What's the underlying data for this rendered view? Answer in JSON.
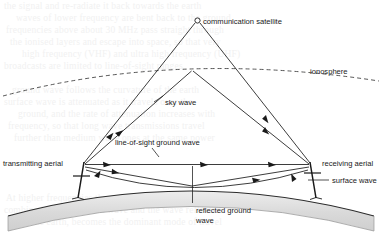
{
  "diagram": {
    "type": "schematic",
    "labels": {
      "satellite": "communication satellite",
      "ionosphere": "ionosphere",
      "sky_wave": "sky wave",
      "line_of_sight": "line-of-sight ground wave",
      "transmitting_aerial": "transmitting aerial",
      "receiving_aerial": "receiving aerial",
      "surface_wave": "surface wave",
      "reflected_ground_wave_line1": "reflected ground",
      "reflected_ground_wave_line2": "wave"
    },
    "colors": {
      "ink": "#1a1a1a",
      "earth_fill": "#d9d9d9",
      "earth_edge": "#2b2b2b",
      "page": "#ffffff",
      "ghost_text": "#f1f1f1"
    },
    "ghost_text": [
      "the signal and re-radiate it back towards the earth",
      "waves of lower frequency are bent back to the ground",
      "frequencies above about 30 MHz pass straight through",
      "the ionised layers and escape into space, so that very",
      "high frequency (VHF) and ultra high frequency (UHF)",
      "broadcasts are limited to line-of-sight ranges",
      "ground wave follows the curvature of the earth",
      "surface wave is attenuated as it travels over the",
      "ground, and the rate of attenuation increases with",
      "frequency, so that long wave transmissions travel",
      "further than medium wave ones at the same power",
      "At higher frequencies the space wave, which is the",
      "combination of the direct wave and the wave reflected",
      "from the earth, becomes the dominant mode of travel"
    ]
  }
}
